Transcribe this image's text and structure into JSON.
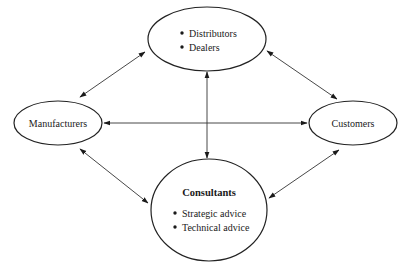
{
  "diagram": {
    "type": "relationship-network",
    "nodes": {
      "top": {
        "id": "distributors-dealers",
        "title": "",
        "bullets": [
          "Distributors",
          "Dealers"
        ]
      },
      "left": {
        "id": "manufacturers",
        "label": "Manufacturers"
      },
      "right": {
        "id": "customers",
        "label": "Customers"
      },
      "bottom": {
        "id": "consultants",
        "title": "Consultants",
        "bullets": [
          "Strategic advice",
          "Technical advice"
        ]
      }
    },
    "edges": [
      {
        "from": "manufacturers",
        "to": "distributors-dealers",
        "direction": "bidirectional"
      },
      {
        "from": "distributors-dealers",
        "to": "customers",
        "direction": "bidirectional"
      },
      {
        "from": "manufacturers",
        "to": "consultants",
        "direction": "bidirectional"
      },
      {
        "from": "consultants",
        "to": "customers",
        "direction": "bidirectional"
      },
      {
        "from": "manufacturers",
        "to": "customers",
        "direction": "bidirectional"
      },
      {
        "from": "distributors-dealers",
        "to": "consultants",
        "direction": "bidirectional"
      }
    ],
    "colors": {
      "stroke": "#222222",
      "text": "#1a1a1a",
      "background": "#ffffff"
    }
  }
}
